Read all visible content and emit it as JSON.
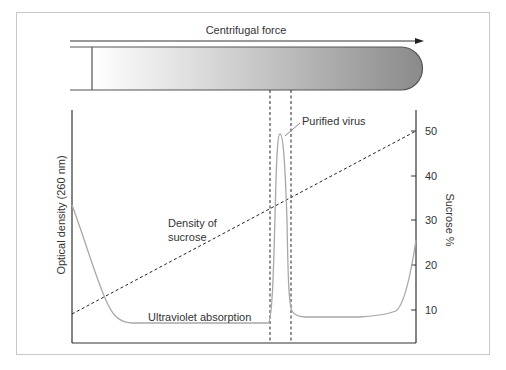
{
  "diagram": {
    "top_label": "Centrifugal force",
    "left_axis_label": "Optical density (260 nm)",
    "right_axis_label": "Sucrose %",
    "right_ticks": [
      "50",
      "40",
      "30",
      "20",
      "10"
    ],
    "annotations": {
      "peak": "Purified virus",
      "density_line_1": "Density of",
      "density_line_2": "sucrose",
      "uv_curve": "Ultraviolet absorption"
    },
    "colors": {
      "tube_light": "#ffffff",
      "tube_dark": "#8c8c8c",
      "uv_curve": "#a8a8a8",
      "axes": "#333333"
    }
  }
}
